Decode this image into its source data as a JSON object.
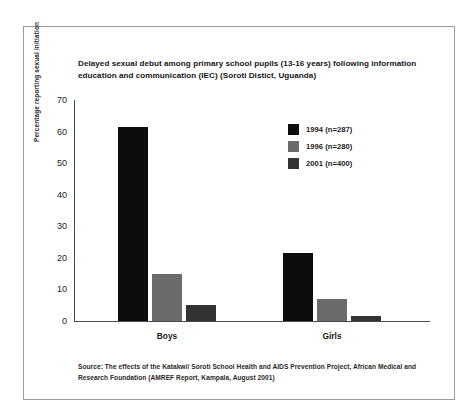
{
  "chart_data": {
    "type": "bar",
    "title": "Delayed sexual debut among primary school pupils (13-16 years) following information education and communication (IEC) (Soroti Distict, Uguanda)",
    "xlabel": "",
    "ylabel": "Percentage reporting sexual initiation",
    "ylim": [
      0,
      70
    ],
    "yticks": [
      0,
      10,
      20,
      30,
      40,
      50,
      60,
      70
    ],
    "ytick_labels": [
      "0",
      "10",
      "20",
      "30",
      "40",
      "50",
      "60",
      "70"
    ],
    "grid": false,
    "legend_position": "upper right",
    "categories": [
      "Boys",
      "Girls"
    ],
    "series": [
      {
        "name": "1994 (n=287)",
        "color": "#0d0d0d",
        "values": [
          61.5,
          21.5
        ]
      },
      {
        "name": "1996 (n=280)",
        "color": "#6b6b6b",
        "values": [
          15.0,
          7.0
        ]
      },
      {
        "name": "2001 (n=400)",
        "color": "#333333",
        "values": [
          5.0,
          1.5
        ]
      }
    ],
    "source_note": "Source: The effects of the Katakwi/ Soroti School Health and AIDS Prevention Project, African Medical and Research Foundation (AMREF Report, Kampala, August 2001)"
  },
  "figure": {
    "background_color": "#ffffff",
    "border_color": "#9a9a9a",
    "axis_color": "#4a4a4a"
  }
}
